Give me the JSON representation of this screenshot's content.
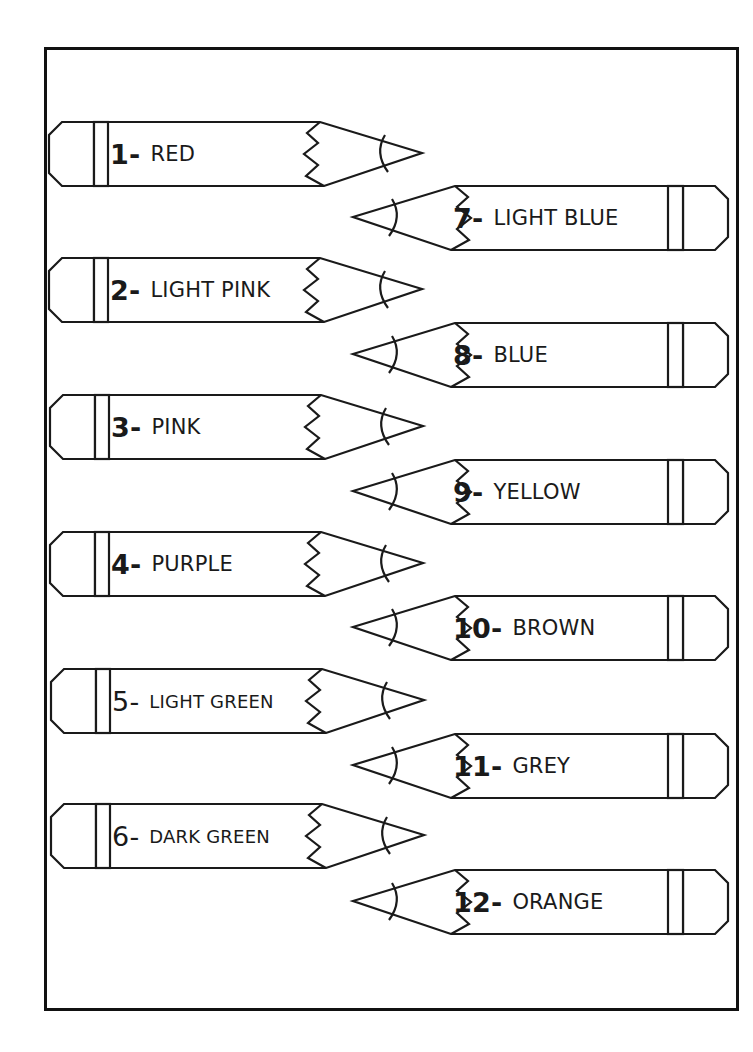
{
  "worksheet": {
    "stroke_color": "#1a1a1a",
    "left_column": [
      {
        "number": "1-",
        "name": "RED",
        "top": 121
      },
      {
        "number": "2-",
        "name": "LIGHT PINK",
        "top": 257
      },
      {
        "number": "3-",
        "name": "PINK",
        "top": 394
      },
      {
        "number": "4-",
        "name": "PURPLE",
        "top": 531
      },
      {
        "number": "5-",
        "name": "LIGHT GREEN",
        "top": 668
      },
      {
        "number": "6-",
        "name": "DARK GREEN",
        "top": 803
      }
    ],
    "right_column": [
      {
        "number": "7-",
        "name": "LIGHT BLUE",
        "top": 185
      },
      {
        "number": "8-",
        "name": "BLUE",
        "top": 322
      },
      {
        "number": "9-",
        "name": "YELLOW",
        "top": 459
      },
      {
        "number": "10-",
        "name": "BROWN",
        "top": 595
      },
      {
        "number": "11-",
        "name": "GREY",
        "top": 733
      },
      {
        "number": "12-",
        "name": "ORANGE",
        "top": 869
      }
    ],
    "icons": {
      "pencil": "pencil-outline-icon"
    }
  }
}
